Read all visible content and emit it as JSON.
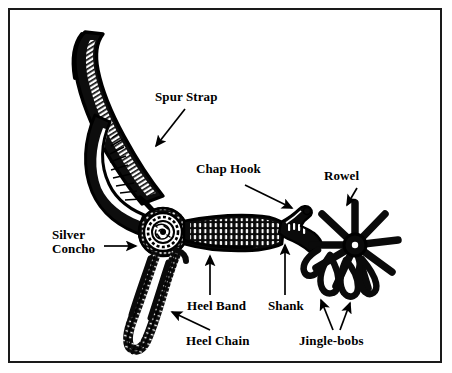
{
  "figure": {
    "background_color": "#ffffff",
    "ink_color": "#000000",
    "border_color": "#1a1a1a",
    "border": true
  },
  "labels": {
    "spur_strap": "Spur Strap",
    "chap_hook": "Chap Hook",
    "rowel": "Rowel",
    "silver_concho": "Silver\nConcho",
    "heel_band": "Heel Band",
    "shank": "Shank",
    "heel_chain": "Heel Chain",
    "jingle_bobs": "Jingle-bobs"
  },
  "callouts": [
    {
      "name": "spur-strap",
      "label": "Spur Strap",
      "direction": "down-left",
      "points_to": "strap band"
    },
    {
      "name": "chap-hook",
      "label": "Chap Hook",
      "direction": "down-right",
      "points_to": "hook bump on shank"
    },
    {
      "name": "rowel",
      "label": "Rowel",
      "direction": "down-left",
      "points_to": "star wheel"
    },
    {
      "name": "silver-concho",
      "label": "Silver Concho",
      "direction": "right",
      "points_to": "round concho disc"
    },
    {
      "name": "heel-band",
      "label": "Heel Band",
      "direction": "up",
      "points_to": "ribbed band"
    },
    {
      "name": "shank",
      "label": "Shank",
      "direction": "up",
      "points_to": "shank arm"
    },
    {
      "name": "heel-chain",
      "label": "Heel Chain",
      "direction": "up-left",
      "points_to": "braided chain loop"
    },
    {
      "name": "jingle-bobs",
      "label": "Jingle-bobs",
      "direction": "up-fork",
      "points_to": "dangling loops"
    }
  ]
}
